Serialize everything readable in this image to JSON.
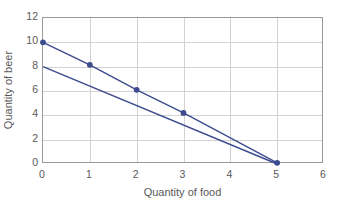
{
  "chart_data": {
    "type": "line",
    "title": "",
    "xlabel": "Quantity of food",
    "ylabel": "Quantity of beer",
    "xlim": [
      0,
      6
    ],
    "ylim": [
      0,
      12
    ],
    "xticks": [
      "0",
      "1",
      "2",
      "3",
      "4",
      "5",
      "6"
    ],
    "yticks": [
      "0",
      "2",
      "4",
      "6",
      "8",
      "10",
      "12"
    ],
    "xtick_values": [
      0,
      1,
      2,
      3,
      4,
      5,
      6
    ],
    "ytick_values": [
      0,
      2,
      4,
      6,
      8,
      10,
      12
    ],
    "grid": "both",
    "legend": "none",
    "series_color": "#3d4b8f",
    "marker_color": "#3d4b8f",
    "series": [
      {
        "name": "budget-line-upper",
        "markers": true,
        "x": [
          0,
          1,
          2,
          3,
          5
        ],
        "y": [
          10,
          8.15,
          6.1,
          4.2,
          0.1
        ]
      },
      {
        "name": "budget-line-lower",
        "markers": false,
        "x": [
          0,
          5
        ],
        "y": [
          8,
          0
        ]
      }
    ]
  },
  "axis": {
    "x_title": "Quantity of food",
    "y_title": "Quantity of beer"
  }
}
